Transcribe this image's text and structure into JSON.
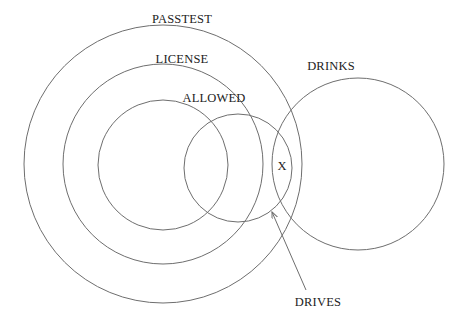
{
  "diagram": {
    "type": "venn",
    "sets": [
      {
        "id": "passtest",
        "label": "PASSTEST",
        "cx": 163,
        "cy": 164,
        "r": 139,
        "label_x": 182,
        "label_y": 19
      },
      {
        "id": "license",
        "label": "LICENSE",
        "cx": 163,
        "cy": 164,
        "r": 100,
        "label_x": 182,
        "label_y": 59
      },
      {
        "id": "allowed",
        "label": "ALLOWED",
        "cx": 163,
        "cy": 165,
        "r": 65,
        "label_x": 214,
        "label_y": 98
      },
      {
        "id": "drives",
        "label": "DRIVES",
        "cx": 238,
        "cy": 168,
        "r": 54,
        "label_x": 318,
        "label_y": 302
      },
      {
        "id": "drinks",
        "label": "DRINKS",
        "cx": 358,
        "cy": 164,
        "r": 86,
        "label_x": 331,
        "label_y": 66
      }
    ],
    "marker": {
      "label": "X",
      "x": 282,
      "y": 166
    },
    "arrow": {
      "from_x": 306,
      "from_y": 290,
      "to_x": 272,
      "to_y": 212,
      "target": "DRIVES"
    },
    "colors": {
      "stroke": "#6e6e6e",
      "text": "#222222",
      "background": "#ffffff"
    }
  }
}
